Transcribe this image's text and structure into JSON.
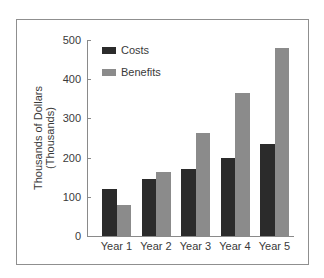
{
  "chart_data": {
    "type": "bar",
    "title": "",
    "xlabel": "",
    "ylabel": "Thousands of Dollars (Thousands)",
    "ylabel_lines": [
      "Thousands of Dollars",
      "(Thousands)"
    ],
    "categories": [
      "Year 1",
      "Year 2",
      "Year 3",
      "Year 4",
      "Year 5"
    ],
    "series": [
      {
        "name": "Costs",
        "color": "#2b2b2b",
        "values": [
          120,
          145,
          170,
          200,
          234
        ]
      },
      {
        "name": "Benefits",
        "color": "#8b8b8b",
        "values": [
          78,
          163,
          262,
          365,
          480
        ]
      }
    ],
    "ylim": [
      0,
      500
    ],
    "yticks": [
      0,
      100,
      200,
      300,
      400,
      500
    ],
    "grid": false,
    "legend_position": "top-left inside plot"
  }
}
